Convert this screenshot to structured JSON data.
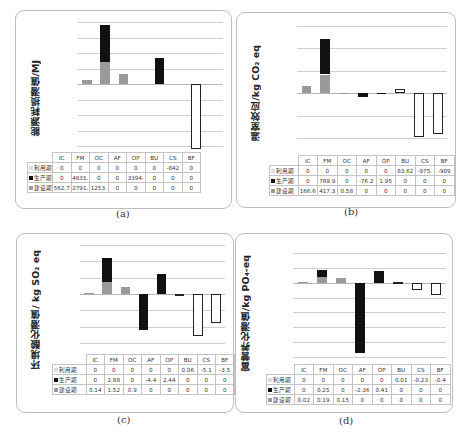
{
  "series_labels": {
    "use": "利用期",
    "prod": "生产期",
    "cons": "建设期"
  },
  "chart_data": [
    {
      "type": "bar",
      "panel": "(a)",
      "title": "",
      "xlabel": "",
      "ylabel": "能源耗损潜值/MJ",
      "categories": [
        "IC",
        "FM",
        "OC",
        "AF",
        "OP",
        "BU",
        "CS",
        "BF"
      ],
      "stacked": true,
      "grid": true,
      "legend_position": "table-left",
      "series": [
        {
          "name": "利用期",
          "values": [
            0,
            0,
            0,
            0,
            0,
            0,
            -8420,
            0
          ],
          "table_text": [
            "0",
            "0",
            "0",
            "0",
            "0",
            "0",
            "-842",
            "0"
          ]
        },
        {
          "name": "生产期",
          "values": [
            0,
            4831,
            0,
            0,
            3394,
            0,
            0,
            0
          ],
          "table_text": [
            "0",
            "4831.",
            "0",
            "0",
            "3394.",
            "0",
            "0",
            "0"
          ]
        },
        {
          "name": "建设期",
          "values": [
            562.7,
            2791,
            1253,
            0,
            0,
            0,
            0,
            0
          ],
          "table_text": [
            "562.7",
            "2791.",
            "1253.",
            "0",
            "0",
            "0",
            "0",
            "0"
          ]
        }
      ],
      "ylim": [
        -8500,
        8000
      ],
      "grid_step": 2000
    },
    {
      "type": "bar",
      "panel": "(b)",
      "title": "",
      "xlabel": "",
      "ylabel": "温室效应/kg CO2 eq",
      "categories": [
        "IC",
        "FM",
        "OC",
        "AF",
        "OP",
        "BU",
        "CS",
        "BF"
      ],
      "stacked": true,
      "grid": true,
      "legend_position": "table-left",
      "series": [
        {
          "name": "利用期",
          "values": [
            0,
            0,
            0,
            0,
            0,
            83.62,
            -975,
            -909
          ],
          "table_text": [
            "0",
            "0",
            "0",
            "0",
            "0",
            "83.62",
            "-975.",
            "-909"
          ]
        },
        {
          "name": "生产期",
          "values": [
            0,
            789.9,
            0,
            -76.2,
            1.95,
            0,
            0,
            0
          ],
          "table_text": [
            "0",
            "789.9",
            "0",
            "-76.2",
            "1.95",
            "0",
            "0",
            "0"
          ]
        },
        {
          "name": "建设期",
          "values": [
            166.6,
            417.3,
            0.58,
            0,
            0,
            0,
            0,
            0
          ],
          "table_text": [
            "166.6",
            "417.3",
            "0.58",
            "0",
            "0",
            "0",
            "0",
            "0"
          ]
        }
      ],
      "ylim": [
        -1000,
        1500
      ],
      "grid_step": 500
    },
    {
      "type": "bar",
      "panel": "(c)",
      "title": "",
      "xlabel": "",
      "ylabel": "环境酸化潜值/ kg SO2 eq",
      "categories": [
        "IC",
        "FM",
        "OC",
        "AF",
        "OP",
        "BU",
        "CS",
        "BF"
      ],
      "stacked": true,
      "grid": true,
      "legend_position": "table-left",
      "series": [
        {
          "name": "利用期",
          "values": [
            0,
            0,
            0,
            0,
            0,
            0.06,
            -5.1,
            -3.5
          ],
          "table_text": [
            "0",
            "0",
            "0",
            "0",
            "0",
            "0.06",
            "-5.1",
            "-3.5"
          ]
        },
        {
          "name": "生产期",
          "values": [
            0,
            2.88,
            0,
            -4.4,
            2.44,
            0,
            0,
            0
          ],
          "table_text": [
            "0",
            "2.88",
            "0",
            "-4.4",
            "2.44",
            "0",
            "0",
            "0"
          ]
        },
        {
          "name": "建设期",
          "values": [
            0.14,
            1.52,
            0.9,
            0,
            0,
            0,
            0,
            0
          ],
          "table_text": [
            "0.14",
            "1.52",
            "0.9",
            "0",
            "0",
            "0",
            "0",
            "0"
          ]
        }
      ],
      "ylim": [
        -6,
        6
      ],
      "grid_step": 2
    },
    {
      "type": "bar",
      "panel": "(d)",
      "title": "",
      "xlabel": "",
      "ylabel": "富营养化潜值/kg PO4-eq",
      "categories": [
        "IC",
        "FM",
        "OC",
        "AF",
        "OP",
        "BU",
        "CS",
        "BF"
      ],
      "stacked": true,
      "grid": true,
      "legend_position": "table-left",
      "series": [
        {
          "name": "利用期",
          "values": [
            0,
            0,
            0,
            0,
            0,
            0.01,
            -0.23,
            -0.4
          ],
          "table_text": [
            "0",
            "0",
            "0",
            "0",
            "0",
            "0.01",
            "-0.23",
            "-0.4"
          ]
        },
        {
          "name": "生产期",
          "values": [
            0,
            0.25,
            0,
            -2.36,
            0.41,
            0,
            0,
            0
          ],
          "table_text": [
            "0",
            "0.25",
            "0",
            "-2.36",
            "0.41",
            "0",
            "0",
            "0"
          ]
        },
        {
          "name": "建设期",
          "values": [
            0.02,
            0.19,
            0.15,
            0,
            0,
            0,
            0,
            0
          ],
          "table_text": [
            "0.02",
            "0.19",
            "0.15",
            "0",
            "0",
            "0",
            "0",
            "0"
          ]
        }
      ],
      "ylim": [
        -2.5,
        1.0
      ],
      "grid_step": 0.5
    }
  ],
  "panels": [
    {
      "caption": "(a)",
      "ylabel": "能源耗损潜值/MJ"
    },
    {
      "caption": "(b)",
      "ylabel": "温室效应/kg CO₂ eq"
    },
    {
      "caption": "(c)",
      "ylabel": "环境酸化潜值/ kg SO₂ eq"
    },
    {
      "caption": "(d)",
      "ylabel": "富营养化潜值/kg PO₄-eq"
    }
  ]
}
